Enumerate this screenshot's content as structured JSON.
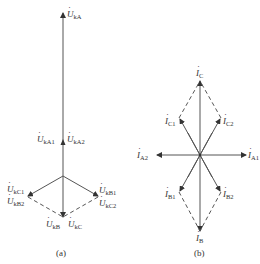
{
  "diagram_a": {
    "caption": "(a)",
    "labels": {
      "UkA": {
        "sym": "U",
        "sub": "kA"
      },
      "UkA1": {
        "sym": "U",
        "sub": "kA1"
      },
      "UkA2": {
        "sym": "U",
        "sub": "kA2"
      },
      "UkC1": {
        "sym": "U",
        "sub": "kC1"
      },
      "UkB2": {
        "sym": "U",
        "sub": "kB2"
      },
      "UkB1": {
        "sym": "U",
        "sub": "kB1"
      },
      "UkC2": {
        "sym": "U",
        "sub": "kC2"
      },
      "UkB": {
        "sym": "U",
        "sub": "kB"
      },
      "UkC": {
        "sym": "U",
        "sub": "kC"
      }
    }
  },
  "diagram_b": {
    "caption": "(b)",
    "labels": {
      "IC": {
        "sym": "I",
        "sub": "C"
      },
      "IC1": {
        "sym": "I",
        "sub": "C1"
      },
      "IC2": {
        "sym": "I",
        "sub": "C2"
      },
      "IA2": {
        "sym": "I",
        "sub": "A2"
      },
      "IA1": {
        "sym": "I",
        "sub": "A1"
      },
      "IB1": {
        "sym": "I",
        "sub": "B1"
      },
      "IB2": {
        "sym": "I",
        "sub": "B2"
      },
      "IB": {
        "sym": "I",
        "sub": "B"
      }
    }
  },
  "colors": {
    "line": "#444444",
    "text": "#333333",
    "background": "#ffffff"
  }
}
